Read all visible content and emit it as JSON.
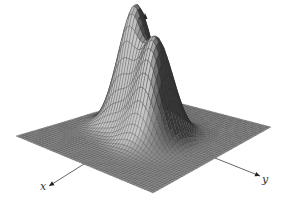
{
  "figure": {
    "type": "3d-surface",
    "axes": {
      "x_label": "x",
      "y_label": "y",
      "z_label": "z"
    },
    "colors": {
      "surface_fill": "#8a8a8a",
      "surface_dark": "#4a4a4a",
      "mesh_lines": "#2a2a2a",
      "axis": "#555555",
      "background": "#ffffff"
    },
    "peaks": [
      {
        "name": "left-peak",
        "apex_px": [
          118,
          21
        ]
      },
      {
        "name": "right-peak",
        "apex_px": [
          166,
          38
        ]
      }
    ],
    "grid_resolution": 48
  }
}
